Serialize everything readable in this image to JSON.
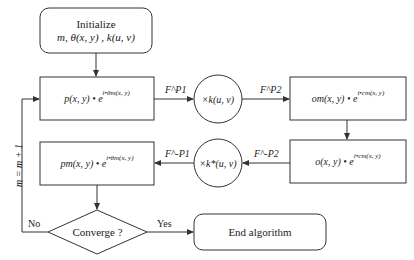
{
  "diagram": {
    "type": "flowchart",
    "nodes": {
      "init": {
        "line1": "Initialize",
        "line2": "m, θ(x, y) , k(u, v)"
      },
      "p_box": {
        "main": "p(x, y) • e",
        "exp": "i•θm(x, y)"
      },
      "multiply_k": {
        "label": "×k(u, v)"
      },
      "om_box": {
        "main": "om(x, y) • e",
        "exp": "i•cm(x, y)"
      },
      "o_box": {
        "main": "o(x, y) • e",
        "exp": "i•cm(x, y)"
      },
      "multiply_kstar": {
        "label": "×k*(u, v)"
      },
      "pm_box": {
        "main": "pm(x, y) • e",
        "exp": "i•θm(x, y)"
      },
      "converge": {
        "label": "Converge ?"
      },
      "end": {
        "label": "End algorithm"
      }
    },
    "edges": {
      "fp1": "F^P1",
      "fp2": "F^P2",
      "fmp2": "F^-P2",
      "fmp1": "F^-P1",
      "yes": "Yes",
      "no": "No",
      "loop": "m = m + 1"
    }
  }
}
